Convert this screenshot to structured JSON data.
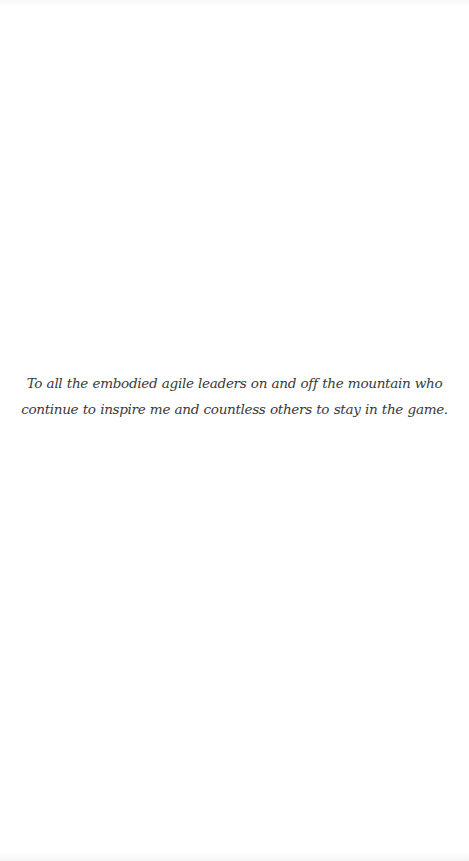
{
  "page": {
    "type": "dedication",
    "background_color": "#ffffff",
    "text_color": "#3a3a3a"
  },
  "dedication": {
    "lines": [
      "To all the embodied agile leaders on and off the mountain who",
      "continue to inspire me and countless others to stay in the game."
    ]
  }
}
